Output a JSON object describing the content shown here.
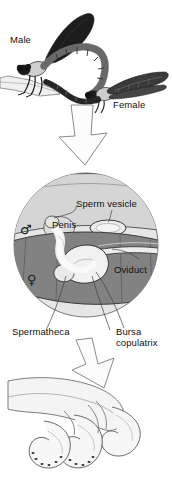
{
  "figure": {
    "background_color": "#ffffff",
    "width": 172,
    "height": 489
  },
  "colors": {
    "male_abdomen_fill": "#d2d2d2",
    "female_abdomen_fill": "#7f7f7f",
    "circle_fill": "#e3e3e3",
    "outline": "#3a3a3a",
    "arrow_fill": "#fbfbfb",
    "arrow_stroke": "#808080",
    "body_dark": "#1c1c1c",
    "wing_dark": "#2b2b2b",
    "label_text": "#111111",
    "detail_fill": "#f2f2f2",
    "detail_stroke": "#6b6b6b"
  },
  "panels": {
    "mating": {
      "name": "mating-pair-panel",
      "labels": {
        "male": "Male",
        "female": "Female"
      }
    },
    "anatomy": {
      "name": "anatomy-inset-panel",
      "symbols": {
        "male_symbol": "♂",
        "female_symbol": "♀"
      },
      "labels": {
        "penis": "Penis",
        "sperm_vesicle": "Sperm vesicle",
        "oviduct": "Oviduct",
        "spermatheca": "Spermatheca",
        "bursa_copulatrix": "Bursa\ncopulatrix"
      }
    },
    "detail": {
      "name": "penis-detail-panel",
      "labels": {}
    }
  },
  "arrows": [
    {
      "name": "arrow-mating-to-anatomy",
      "direction": "down"
    },
    {
      "name": "arrow-anatomy-to-detail",
      "direction": "down-right"
    }
  ]
}
